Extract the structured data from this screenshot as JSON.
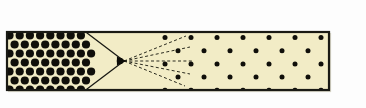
{
  "figure": {
    "canvas": {
      "width": 366,
      "height": 108
    },
    "background_color": "#fdfdfd"
  },
  "frame": {
    "name": "enclosing-rectangle",
    "x": 7,
    "y": 32,
    "width": 322,
    "height": 58,
    "fill_color": "#f2ecc6",
    "border_color": "#1a1a14",
    "border_width": 2.2,
    "outer_shadow_color": "#b8b49a"
  },
  "dense_field": {
    "name": "dense-dot-field-left",
    "description": "Dense staggered hexagonal array of large dark dots occupying the left portion",
    "region_x_start": 8,
    "region_x_end": 96,
    "dot_color": "#100f0a",
    "dot_radius": 4.1,
    "spacing_x": 10.2,
    "spacing_y": 9.0,
    "row_offset_x": 5.1,
    "rows": 7,
    "columns": 10
  },
  "wedge": {
    "name": "converging-wedge-lines",
    "description": "Two solid lines converging from the dense field edge to the focal point",
    "line_color": "#1a1a14",
    "line_width": 1.3,
    "top_start": {
      "x": 87,
      "y": 33
    },
    "bottom_start": {
      "x": 87,
      "y": 89
    },
    "apex": {
      "x": 124,
      "y": 61
    }
  },
  "focal_point": {
    "name": "focal-point-marker",
    "x": 124,
    "y": 61,
    "color": "#0d0d08",
    "size": 4.4
  },
  "rays": {
    "name": "diverging-dashed-rays",
    "description": "Fan of dashed rays emanating rightward from the focal point",
    "color": "#2a2a1e",
    "line_width": 1.0,
    "dash_pattern": "3,2.4",
    "origin": {
      "x": 124,
      "y": 61
    },
    "endpoints": [
      {
        "x": 186,
        "y": 36
      },
      {
        "x": 190,
        "y": 47
      },
      {
        "x": 192,
        "y": 61
      },
      {
        "x": 190,
        "y": 74
      },
      {
        "x": 185,
        "y": 86
      }
    ]
  },
  "sparse_field": {
    "name": "sparse-dot-field-right",
    "description": "Sparse staggered grid of small dark dots occupying the right portion",
    "region_x_start": 165,
    "region_x_end": 328,
    "dot_color": "#100f0a",
    "dot_radius": 2.5,
    "spacing_x": 26.0,
    "spacing_y": 13.2,
    "row_offset_x": 13.0,
    "rows": 5,
    "columns": 7
  },
  "legend": {
    "dense_label": "",
    "sparse_label": "",
    "focal_label": ""
  }
}
